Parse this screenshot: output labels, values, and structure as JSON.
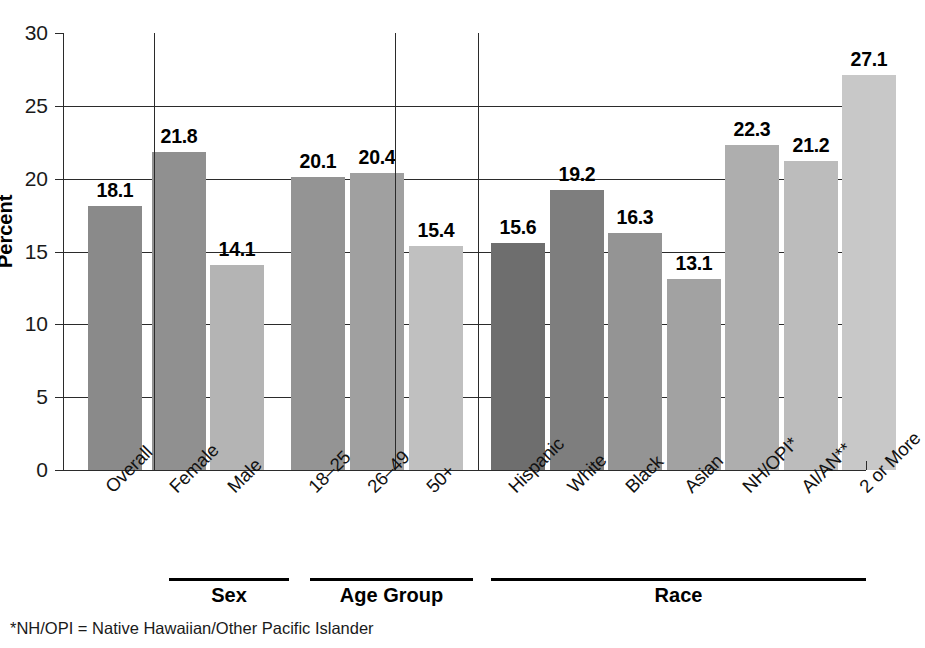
{
  "chart_data": {
    "type": "bar",
    "title": "",
    "xlabel": "",
    "ylabel": "Percent",
    "ylim": [
      0,
      30
    ],
    "yticks": [
      0,
      5,
      10,
      15,
      20,
      25,
      30
    ],
    "ytick_labels": [
      "0",
      "5",
      "10",
      "15",
      "20",
      "25",
      "30"
    ],
    "grid": true,
    "legend": "none",
    "categories": [
      "Overall",
      "Female",
      "Male",
      "18–25",
      "26–49",
      "50+",
      "Hispanic",
      "White",
      "Black",
      "Asian",
      "NH/OPI*",
      "AI/AN**",
      "2 or More"
    ],
    "values": [
      18.1,
      21.8,
      14.1,
      20.1,
      20.4,
      15.4,
      15.6,
      19.2,
      16.3,
      13.1,
      22.3,
      21.2,
      27.1
    ],
    "value_labels": [
      "18.1",
      "21.8",
      "14.1",
      "20.1",
      "20.4",
      "15.4",
      "15.6",
      "19.2",
      "16.3",
      "13.1",
      "22.3",
      "21.2",
      "27.1"
    ],
    "bar_colors": [
      "#8a8a8a",
      "#909090",
      "#b4b4b4",
      "#949494",
      "#a0a0a0",
      "#c0c0c0",
      "#6e6e6e",
      "#7e7e7e",
      "#949494",
      "#a2a2a2",
      "#aeaeae",
      "#bcbcbc",
      "#c8c8c8"
    ],
    "groups": [
      {
        "label": "",
        "categories": [
          "Overall"
        ]
      },
      {
        "label": "Sex",
        "categories": [
          "Female",
          "Male"
        ]
      },
      {
        "label": "Age Group",
        "categories": [
          "18–25",
          "26–49",
          "50+"
        ]
      },
      {
        "label": "Race",
        "categories": [
          "Hispanic",
          "White",
          "Black",
          "Asian",
          "NH/OPI*",
          "AI/AN**",
          "2 or More"
        ]
      }
    ]
  },
  "axis": {
    "y_title": "Percent"
  },
  "group_bands": [
    {
      "label": "Sex"
    },
    {
      "label": "Age Group"
    },
    {
      "label": "Race"
    }
  ],
  "footnotes": [
    "*NH/OPI = Native Hawaiian/Other Pacific Islander"
  ],
  "colors": {
    "axis": "#2b2b2b",
    "text": "#111111",
    "background": "#ffffff"
  }
}
